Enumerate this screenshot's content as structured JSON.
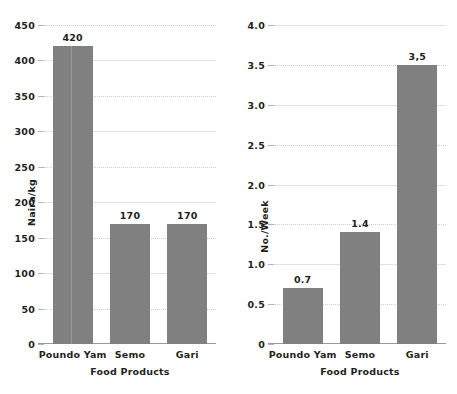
{
  "chart_data": [
    {
      "type": "bar",
      "panel": "left",
      "title": "",
      "xlabel": "Food Products",
      "ylabel": "Naira/kg",
      "categories": [
        "Poundo Yam",
        "Semo",
        "Gari"
      ],
      "values": [
        420,
        170,
        170
      ],
      "value_labels": [
        "420",
        "170",
        "170"
      ],
      "ylim": [
        0,
        450
      ],
      "yticks": [
        0,
        50,
        100,
        150,
        200,
        250,
        300,
        350,
        400,
        450
      ],
      "ytick_labels": [
        "0",
        "50",
        "100",
        "150",
        "200",
        "250",
        "300",
        "350",
        "400",
        "450"
      ],
      "grid": true,
      "legend": null,
      "bar_color": "#808080"
    },
    {
      "type": "bar",
      "panel": "right",
      "title": "",
      "xlabel": "Food Products",
      "ylabel": "No./Week",
      "categories": [
        "Poundo Yam",
        "Semo",
        "Gari"
      ],
      "values": [
        0.7,
        1.4,
        3.5
      ],
      "value_labels": [
        "0.7",
        "1.4",
        "3,5"
      ],
      "ylim": [
        0,
        4.0
      ],
      "yticks": [
        0,
        0.5,
        1.0,
        1.5,
        2.0,
        2.5,
        3.0,
        3.5,
        4.0
      ],
      "ytick_labels": [
        "0",
        "0.5",
        "1.0",
        "1.5",
        "2.0",
        "2.5",
        "3.0",
        "3.5",
        "4.0"
      ],
      "grid": true,
      "legend": null,
      "bar_color": "#808080"
    }
  ],
  "colors": {
    "bar": "#808080",
    "bar_seam": "#9b9b9b",
    "gridline": "#cfcfcf",
    "axis": "#9a9a9a",
    "text": "#231f20",
    "background": "#ffffff"
  }
}
